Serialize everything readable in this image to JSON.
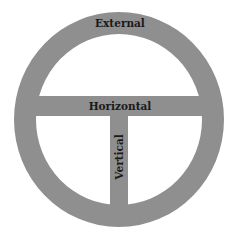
{
  "diagram": {
    "labels": {
      "external": "External",
      "horizontal": "Horizontal",
      "vertical": "Vertical"
    },
    "colors": {
      "shape_fill": "#8f8f8f",
      "text": "#1a1a1a",
      "background": "#ffffff"
    }
  }
}
